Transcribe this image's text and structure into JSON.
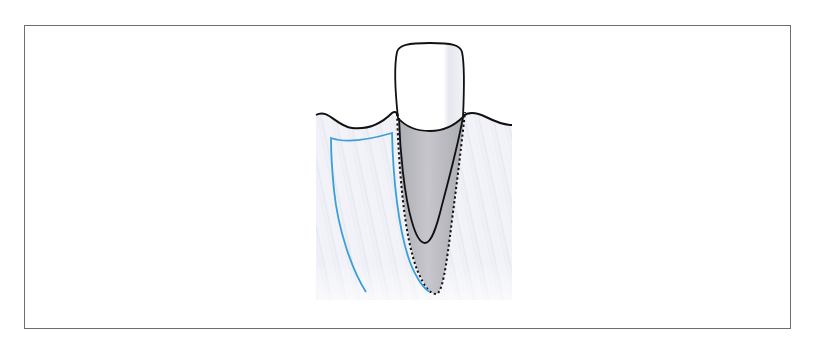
{
  "figure": {
    "colors": {
      "frame_border": "#6e6e6e",
      "background": "#ffffff",
      "bone_fill": "#eceef4",
      "bone_stripe": "#f6f3fa",
      "gum_line": "#111111",
      "tooth_outline": "#111111",
      "crown_fill": "#ffffff",
      "crown_shade": "#e7e8ee",
      "shaded_region": "#b9b9bf",
      "dotted_outline": "#111111",
      "blue_outline": "#3a9fd8"
    },
    "elements": [
      {
        "name": "crown",
        "label": ""
      },
      {
        "name": "root",
        "label": ""
      },
      {
        "name": "gingival-line",
        "label": ""
      },
      {
        "name": "dotted-boundary",
        "label": ""
      },
      {
        "name": "blue-outline",
        "label": ""
      }
    ]
  }
}
